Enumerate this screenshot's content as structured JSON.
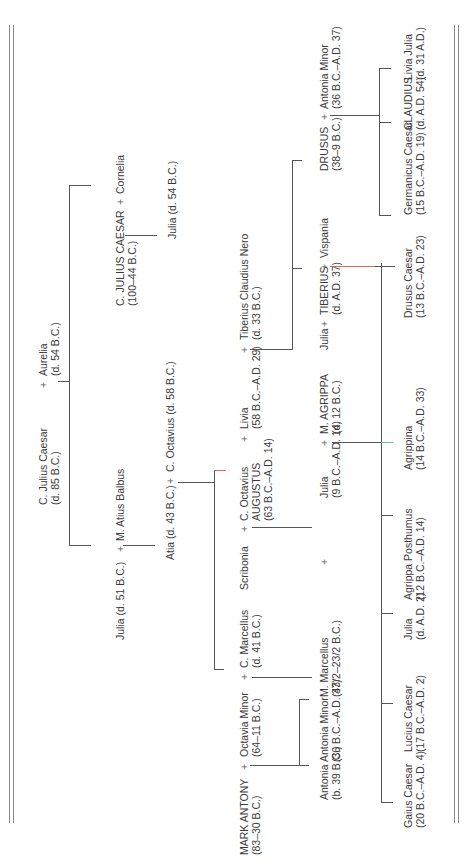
{
  "diagram": {
    "type": "family-tree",
    "orientation": "rotated-90-ccw",
    "sep": "+",
    "era_bc": "B.C.",
    "era_ad": "A.D.",
    "gen1": {
      "cjc_senior": {
        "name": "C. Julius Caesar",
        "dates": "(d. 85 B.C.)"
      },
      "aurelia": {
        "name": "Aurelia",
        "dates": "(d. 54 B.C.)"
      }
    },
    "gen2": {
      "julia_51": {
        "name": "Julia (d. 51 B.C.)"
      },
      "balbus": {
        "name": "M. Atius Balbus"
      },
      "caesar": {
        "name": "C. JULIUS CAESAR",
        "dates": "(100–44 B.C.)"
      },
      "cornelia": {
        "name": "Cornelia"
      }
    },
    "gen3": {
      "atia": {
        "name": "Atia (d. 43 B.C.)"
      },
      "octavius_sr": {
        "name": "C. Octavius (d. 58 B.C.)"
      },
      "julia_54": {
        "name": "Julia (d. 54 B.C.)"
      }
    },
    "gen4": {
      "antony": {
        "name": "MARK ANTONY",
        "dates": "(83–30 B.C.)"
      },
      "octavia": {
        "name": "Octavia Minor",
        "dates": "(64–11 B.C.)"
      },
      "marcellus_c": {
        "name": "C. Marcellus",
        "dates": "(d. 41 B.C.)"
      },
      "scribonia": {
        "name": "Scribonia"
      },
      "augustus": {
        "name1": "C. Octavius",
        "name2": "AUGUSTUS",
        "dates": "(63 B.C.–A.D. 14)"
      },
      "livia": {
        "name": "Livia",
        "dates": "(58 B.C.–A.D. 29)"
      },
      "nero": {
        "name": "Tiberius Claudius Nero",
        "dates": "(d. 33 B.C.)"
      }
    },
    "gen5": {
      "antonia": {
        "name": "Antonia",
        "dates": "(b. 39 B.C.)"
      },
      "antonia_minor": {
        "name": "Antonia Minor",
        "dates": "(36 B.C.–A.D. 37)"
      },
      "marcellus_m": {
        "name": "M. Marcellus",
        "dates": "(43/2–23/2 B.C.)"
      },
      "julia_aug": {
        "name": "Julia",
        "dates": "(9 B.C.–A.D. 14)"
      },
      "agrippa": {
        "name": "M. AGRIPPA",
        "dates": "(d. 12 B.C.)"
      },
      "julia_tib": {
        "name": "Julia"
      },
      "tiberius": {
        "name": "TIBERIUS",
        "dates": "(d. A.D. 37)"
      },
      "vispania": {
        "name": "Vispania"
      },
      "drusus": {
        "name": "DRUSUS",
        "dates": "(38–9 B.C.)"
      },
      "antonia_minor2": {
        "name": "Antonia Minor",
        "dates": "(36 B.C.–A.D. 37)"
      }
    },
    "gen6": [
      {
        "name": "Gaius Caesar",
        "dates": "(20 B.C.–A.D. 4)"
      },
      {
        "name": "Lucius Caesar",
        "dates": "(17 B.C.–A.D. 2)"
      },
      {
        "name": "Julia",
        "dates": "(d. A.D. 2)"
      },
      {
        "name": "Agrippa Posthumus",
        "dates": "(12 B.C.–A.D. 14)"
      },
      {
        "name": "Agrippina",
        "dates": "(14 B.C.–A.D. 33)"
      },
      {
        "name": "Drusus Caesar",
        "dates": "(13 B.C.–A.D. 23)"
      },
      {
        "name": "Germanicus Caesar",
        "dates": "(15 B.C.–A.D. 19)"
      },
      {
        "name": "CLAUDIUS",
        "dates": "(d. A.D. 54)"
      },
      {
        "name": "Livia Julia",
        "dates": "(d. 31 A.D.)"
      }
    ]
  }
}
